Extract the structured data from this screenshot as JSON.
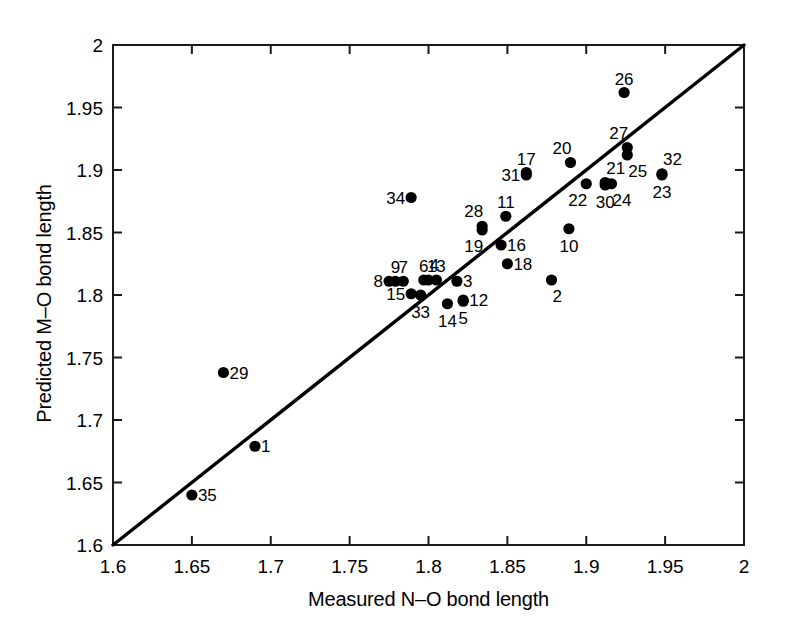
{
  "chart_data": {
    "type": "scatter",
    "title": "",
    "xlabel": "Measured N–O bond length",
    "ylabel": "Predicted M–O bond length",
    "xlim": [
      1.6,
      2.0
    ],
    "ylim": [
      1.6,
      2.0
    ],
    "xticks": [
      "1.6",
      "1.65",
      "1.7",
      "1.75",
      "1.8",
      "1.85",
      "1.9",
      "1.95",
      "2"
    ],
    "yticks": [
      "1.6",
      "1.65",
      "1.7",
      "1.75",
      "1.8",
      "1.85",
      "1.9",
      "1.95",
      "2"
    ],
    "xtick_values": [
      1.6,
      1.65,
      1.7,
      1.75,
      1.8,
      1.85,
      1.9,
      1.95,
      2.0
    ],
    "ytick_values": [
      1.6,
      1.65,
      1.7,
      1.75,
      1.8,
      1.85,
      1.9,
      1.95,
      2.0
    ],
    "grid": false,
    "legend": null,
    "marker": "filled-circle",
    "marker_color": "#000000",
    "reference_line": {
      "name": "y = x identity line",
      "from": [
        1.6,
        1.6
      ],
      "to": [
        2.0,
        2.0
      ],
      "color": "#000000"
    },
    "points": [
      {
        "label": "1",
        "x": 1.69,
        "y": 1.679,
        "lpos": "right"
      },
      {
        "label": "2",
        "x": 1.878,
        "y": 1.812,
        "lpos": "br"
      },
      {
        "label": "3",
        "x": 1.818,
        "y": 1.811,
        "lpos": "right"
      },
      {
        "label": "4",
        "x": 1.8,
        "y": 1.812,
        "lpos": "ar"
      },
      {
        "label": "5",
        "x": 1.822,
        "y": 1.795,
        "lpos": "below"
      },
      {
        "label": "6",
        "x": 1.797,
        "y": 1.812,
        "lpos": "above"
      },
      {
        "label": "7",
        "x": 1.784,
        "y": 1.811,
        "lpos": "above"
      },
      {
        "label": "8",
        "x": 1.775,
        "y": 1.811,
        "lpos": "left"
      },
      {
        "label": "9",
        "x": 1.779,
        "y": 1.811,
        "lpos": "above"
      },
      {
        "label": "10",
        "x": 1.889,
        "y": 1.853,
        "lpos": "below"
      },
      {
        "label": "11",
        "x": 1.849,
        "y": 1.863,
        "lpos": "above"
      },
      {
        "label": "12",
        "x": 1.822,
        "y": 1.796,
        "lpos": "right"
      },
      {
        "label": "13",
        "x": 1.805,
        "y": 1.812,
        "lpos": "above"
      },
      {
        "label": "14",
        "x": 1.812,
        "y": 1.793,
        "lpos": "below"
      },
      {
        "label": "15",
        "x": 1.789,
        "y": 1.801,
        "lpos": "left"
      },
      {
        "label": "16",
        "x": 1.846,
        "y": 1.84,
        "lpos": "right"
      },
      {
        "label": "17",
        "x": 1.862,
        "y": 1.898,
        "lpos": "above"
      },
      {
        "label": "18",
        "x": 1.85,
        "y": 1.825,
        "lpos": "right"
      },
      {
        "label": "19",
        "x": 1.834,
        "y": 1.852,
        "lpos": "bl"
      },
      {
        "label": "20",
        "x": 1.89,
        "y": 1.906,
        "lpos": "al"
      },
      {
        "label": "21",
        "x": 1.912,
        "y": 1.89,
        "lpos": "ar"
      },
      {
        "label": "22",
        "x": 1.9,
        "y": 1.889,
        "lpos": "bl"
      },
      {
        "label": "23",
        "x": 1.948,
        "y": 1.896,
        "lpos": "below"
      },
      {
        "label": "24",
        "x": 1.916,
        "y": 1.889,
        "lpos": "br"
      },
      {
        "label": "25",
        "x": 1.926,
        "y": 1.912,
        "lpos": "br"
      },
      {
        "label": "26",
        "x": 1.924,
        "y": 1.962,
        "lpos": "above"
      },
      {
        "label": "27",
        "x": 1.926,
        "y": 1.918,
        "lpos": "al"
      },
      {
        "label": "28",
        "x": 1.834,
        "y": 1.855,
        "lpos": "al"
      },
      {
        "label": "29",
        "x": 1.67,
        "y": 1.738,
        "lpos": "right"
      },
      {
        "label": "30",
        "x": 1.912,
        "y": 1.888,
        "lpos": "below"
      },
      {
        "label": "31",
        "x": 1.862,
        "y": 1.896,
        "lpos": "left"
      },
      {
        "label": "32",
        "x": 1.948,
        "y": 1.897,
        "lpos": "ar"
      },
      {
        "label": "33",
        "x": 1.795,
        "y": 1.8,
        "lpos": "below"
      },
      {
        "label": "34",
        "x": 1.789,
        "y": 1.878,
        "lpos": "left"
      },
      {
        "label": "35",
        "x": 1.65,
        "y": 1.64,
        "lpos": "right"
      }
    ]
  },
  "axes": {
    "x_axis_name": "Measured N–O bond length",
    "y_axis_name": "Predicted M–O bond length"
  }
}
